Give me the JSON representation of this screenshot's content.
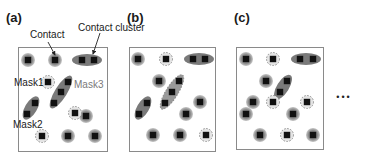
{
  "figure": {
    "width": 366,
    "height": 158,
    "colors": {
      "frame": "#8a8a8a",
      "halo": "#8c8c8c",
      "halo_outer": "#b8b8b8",
      "contact": "#111111",
      "dashed": "#8a8a8a",
      "cluster": "#7a7a7a",
      "text_dark": "#1a1a1a",
      "text_grey": "#7a7a7a",
      "arrow": "#222222"
    },
    "ellipsis": {
      "text": "•••",
      "x": 344,
      "y": 100
    },
    "panels": [
      {
        "id": "a",
        "label": "(a)",
        "label_pos": [
          6,
          22
        ],
        "frame": {
          "x": 18,
          "y": 47,
          "w": 89,
          "h": 104
        },
        "contacts": [
          {
            "x": 28,
            "y": 60,
            "style": "halo"
          },
          {
            "x": 55,
            "y": 60,
            "style": "halo"
          },
          {
            "x": 48,
            "y": 82,
            "style": "dashed"
          },
          {
            "x": 86,
            "y": 116,
            "style": "halo"
          },
          {
            "x": 75,
            "y": 113,
            "style": "dashed"
          },
          {
            "x": 42,
            "y": 136,
            "style": "dashed"
          },
          {
            "x": 68,
            "y": 136,
            "style": "halo"
          },
          {
            "x": 95,
            "y": 136,
            "style": "halo"
          }
        ],
        "clusters": [
          {
            "cx": 87,
            "cy": 60,
            "rx": 15,
            "ry": 6,
            "rot": 0,
            "pts": [
              [
                82,
                60
              ],
              [
                94,
                60
              ]
            ],
            "style": "solid"
          },
          {
            "cx": 61,
            "cy": 92,
            "rx": 19,
            "ry": 6,
            "rot": -58,
            "pts": [
              [
                68,
                82
              ],
              [
                61,
                92
              ],
              [
                54,
                103
              ]
            ],
            "style": "solid"
          },
          {
            "cx": 31,
            "cy": 108,
            "rx": 13,
            "ry": 6,
            "rot": -60,
            "pts": [
              [
                35,
                103
              ],
              [
                27,
                114
              ]
            ],
            "style": "solid"
          }
        ],
        "texts": [
          {
            "key": "contact",
            "text": "Contact",
            "x": 30,
            "y": 38,
            "color": "text_dark",
            "size": 10
          },
          {
            "key": "contact_cluster",
            "text": "Contact cluster",
            "x": 78,
            "y": 31,
            "color": "text_dark",
            "size": 10
          },
          {
            "key": "mask1",
            "text": "Mask1",
            "x": 14,
            "y": 86,
            "color": "text_dark",
            "size": 10
          },
          {
            "key": "mask3",
            "text": "Mask3",
            "x": 74,
            "y": 88,
            "color": "text_grey",
            "size": 10
          },
          {
            "key": "mask2",
            "text": "Mask2",
            "x": 13,
            "y": 128,
            "color": "text_dark",
            "size": 10
          }
        ],
        "arrows": [
          {
            "x1": 48,
            "y1": 42,
            "x2": 55,
            "y2": 55
          },
          {
            "x1": 100,
            "y1": 33,
            "x2": 93,
            "y2": 54
          }
        ]
      },
      {
        "id": "b",
        "label": "(b)",
        "label_pos": [
          127,
          22
        ],
        "frame": {
          "x": 129,
          "y": 47,
          "w": 86,
          "h": 104
        },
        "contacts": [
          {
            "x": 138,
            "y": 59,
            "style": "halo"
          },
          {
            "x": 166,
            "y": 59,
            "style": "dashed"
          },
          {
            "x": 159,
            "y": 81,
            "style": "halo"
          },
          {
            "x": 200,
            "y": 102,
            "style": "halo"
          },
          {
            "x": 186,
            "y": 114,
            "style": "halo"
          },
          {
            "x": 153,
            "y": 135,
            "style": "halo"
          },
          {
            "x": 180,
            "y": 135,
            "style": "halo"
          },
          {
            "x": 206,
            "y": 135,
            "style": "dashed"
          }
        ],
        "clusters": [
          {
            "cx": 199,
            "cy": 59,
            "rx": 15,
            "ry": 6,
            "rot": 0,
            "pts": [
              [
                193,
                59
              ],
              [
                205,
                59
              ]
            ],
            "style": "solid"
          },
          {
            "cx": 172,
            "cy": 92,
            "rx": 20,
            "ry": 6,
            "rot": -58,
            "pts": [
              [
                179,
                81
              ],
              [
                172,
                92
              ],
              [
                165,
                103
              ]
            ],
            "style": "dashed"
          },
          {
            "cx": 143,
            "cy": 108,
            "rx": 13,
            "ry": 6,
            "rot": -60,
            "pts": [
              [
                147,
                103
              ],
              [
                139,
                114
              ]
            ],
            "style": "solid"
          }
        ],
        "texts": [],
        "arrows": []
      },
      {
        "id": "c",
        "label": "(c)",
        "label_pos": [
          234,
          22
        ],
        "frame": {
          "x": 236,
          "y": 47,
          "w": 87,
          "h": 102
        },
        "contacts": [
          {
            "x": 246,
            "y": 59,
            "style": "halo"
          },
          {
            "x": 273,
            "y": 59,
            "style": "dashed"
          },
          {
            "x": 266,
            "y": 81,
            "style": "halo"
          },
          {
            "x": 253,
            "y": 102,
            "style": "halo"
          },
          {
            "x": 273,
            "y": 102,
            "style": "dashed"
          },
          {
            "x": 307,
            "y": 102,
            "style": "dashed"
          },
          {
            "x": 246,
            "y": 114,
            "style": "halo"
          },
          {
            "x": 293,
            "y": 114,
            "style": "halo"
          },
          {
            "x": 260,
            "y": 135,
            "style": "halo"
          },
          {
            "x": 287,
            "y": 135,
            "style": "dashed"
          },
          {
            "x": 313,
            "y": 135,
            "style": "halo"
          }
        ],
        "clusters": [
          {
            "cx": 306,
            "cy": 59,
            "rx": 15,
            "ry": 6,
            "rot": 0,
            "pts": [
              [
                300,
                59
              ],
              [
                313,
                59
              ]
            ],
            "style": "solid"
          },
          {
            "cx": 283,
            "cy": 87,
            "rx": 14,
            "ry": 6,
            "rot": -58,
            "pts": [
              [
                287,
                81
              ],
              [
                280,
                92
              ]
            ],
            "style": "solid"
          }
        ],
        "texts": [],
        "arrows": []
      }
    ]
  }
}
